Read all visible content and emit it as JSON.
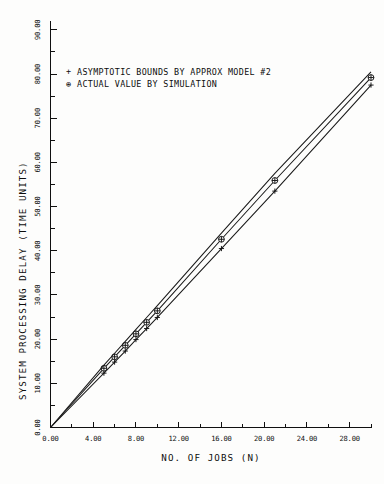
{
  "chart_data": {
    "type": "line",
    "title": "",
    "xlabel": "NO. OF JOBS (N)",
    "ylabel": "SYSTEM PROCESSING DELAY (TIME UNITS)",
    "xlim": [
      0,
      30
    ],
    "ylim": [
      0,
      92
    ],
    "grid": false,
    "legend_position": "upper-left-inside",
    "xticks": [
      0,
      4,
      8,
      12,
      16,
      20,
      24,
      28
    ],
    "xtick_labels": [
      "0.00",
      "4.00",
      "8.00",
      "12.00",
      "16.00",
      "20.00",
      "24.00",
      "28.00"
    ],
    "xtick_minor": [
      2,
      6,
      10,
      14,
      18,
      22,
      26,
      30
    ],
    "yticks": [
      0,
      10,
      20,
      30,
      40,
      50,
      60,
      70,
      80,
      90
    ],
    "ytick_labels": [
      "0.00",
      "10.00",
      "20.00",
      "30.00",
      "40.00",
      "50.00",
      "60.00",
      "70.00",
      "80.00",
      "90.00"
    ],
    "ytick_minor": [
      5,
      15,
      25,
      35,
      45,
      55,
      65,
      75,
      85
    ],
    "series": [
      {
        "name": "ASYMPTOTIC BOUNDS BY APPROX MODEL #2",
        "marker": "plus",
        "legend_symbol": "+",
        "color": "#1a1a1a",
        "x": [
          0,
          5,
          6,
          7,
          8,
          9,
          10,
          16,
          21,
          30
        ],
        "values": [
          0,
          12.3,
          14.8,
          17.3,
          19.9,
          22.4,
          24.9,
          40.5,
          53.5,
          77.5
        ]
      },
      {
        "name": "ACTUAL VALUE BY SIMULATION",
        "marker": "circle-plus",
        "legend_symbol": "⊕",
        "color": "#1a1a1a",
        "x": [
          0,
          5,
          6,
          7,
          8,
          9,
          10,
          16,
          21,
          30
        ],
        "values": [
          0,
          13.4,
          16.0,
          18.6,
          21.2,
          23.8,
          26.4,
          42.6,
          55.9,
          79.2
        ]
      },
      {
        "name": "upper-bound-guide",
        "marker": "none",
        "legend_symbol": "",
        "color": "#1a1a1a",
        "x": [
          0,
          5,
          6,
          7,
          8,
          9,
          10,
          16,
          21,
          30
        ],
        "values": [
          0,
          14.1,
          16.8,
          19.5,
          22.2,
          24.9,
          27.6,
          44.0,
          57.5,
          80.5
        ]
      }
    ]
  },
  "legend": {
    "entries": [
      {
        "symbol": "+",
        "label": "ASYMPTOTIC BOUNDS BY APPROX MODEL #2"
      },
      {
        "symbol": "⊕",
        "label": "ACTUAL VALUE BY SIMULATION"
      }
    ]
  },
  "axes": {
    "x_title": "NO. OF JOBS (N)",
    "y_title": "SYSTEM PROCESSING DELAY (TIME UNITS)"
  }
}
